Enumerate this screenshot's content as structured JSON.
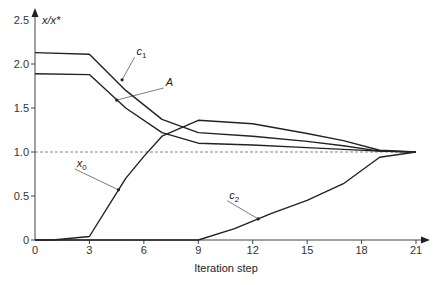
{
  "chart_data": {
    "type": "line",
    "title": "",
    "xlabel": "Iteration step",
    "ylabel": "x/x*",
    "xlim": [
      0,
      21
    ],
    "ylim": [
      0,
      2.5
    ],
    "xticks": [
      0,
      3,
      6,
      9,
      12,
      15,
      18,
      21
    ],
    "xtick_labels": [
      "0",
      "3",
      "6",
      "9",
      "12",
      "15",
      "18",
      "21"
    ],
    "yticks": [
      0,
      0.5,
      1.0,
      1.5,
      2.0,
      2.5
    ],
    "ytick_labels": [
      "0",
      "0.5",
      "1.0",
      "1.5",
      "2.0",
      "2.5"
    ],
    "grid": false,
    "reference_line": {
      "y": 1.0,
      "style": "dashed"
    },
    "legend": "inline labels with leader lines",
    "series": [
      {
        "name": "c1",
        "label_main": "c",
        "label_sub": "1",
        "x": [
          0,
          3,
          5,
          7,
          9,
          12,
          15,
          17,
          19,
          21
        ],
        "values": [
          2.13,
          2.11,
          1.7,
          1.37,
          1.22,
          1.18,
          1.12,
          1.07,
          1.01,
          1.0
        ],
        "label_pos": {
          "x": 5.6,
          "y": 2.1
        },
        "leader_from": {
          "x": 4.8,
          "y": 1.82
        }
      },
      {
        "name": "A",
        "label_main": "A",
        "label_sub": "",
        "x": [
          0,
          3,
          5,
          7,
          9,
          12,
          15,
          17,
          19,
          21
        ],
        "values": [
          1.89,
          1.88,
          1.5,
          1.22,
          1.1,
          1.08,
          1.05,
          1.03,
          1.01,
          1.0
        ],
        "label_pos": {
          "x": 7.2,
          "y": 1.75
        },
        "leader_from": {
          "x": 4.5,
          "y": 1.59
        }
      },
      {
        "name": "x0",
        "label_main": "x",
        "label_sub": "0",
        "x": [
          0,
          1,
          3,
          5,
          6,
          7,
          9,
          12,
          15,
          17,
          19,
          21
        ],
        "values": [
          0,
          0,
          0.04,
          0.7,
          0.95,
          1.18,
          1.36,
          1.32,
          1.21,
          1.13,
          1.02,
          1.0
        ],
        "label_pos": {
          "x": 2.3,
          "y": 0.83
        },
        "leader_from": {
          "x": 4.6,
          "y": 0.57
        }
      },
      {
        "name": "c2",
        "label_main": "c",
        "label_sub": "2",
        "x": [
          0,
          9,
          11,
          13,
          15,
          17,
          19,
          21
        ],
        "values": [
          0,
          0,
          0.13,
          0.3,
          0.45,
          0.64,
          0.94,
          1.0
        ],
        "label_pos": {
          "x": 10.7,
          "y": 0.47
        },
        "leader_from": {
          "x": 12.3,
          "y": 0.24
        }
      }
    ]
  }
}
